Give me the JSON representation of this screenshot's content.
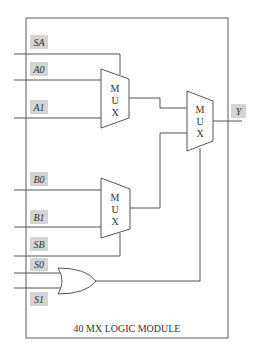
{
  "diagram": {
    "caption": "40 MX LOGIC MODULE",
    "inputs": [
      {
        "id": "SA",
        "label": "SA"
      },
      {
        "id": "A0",
        "label": "A0"
      },
      {
        "id": "A1",
        "label": "A1"
      },
      {
        "id": "B0",
        "label": "B0"
      },
      {
        "id": "B1",
        "label": "B1"
      },
      {
        "id": "SB",
        "label": "SB"
      },
      {
        "id": "S0",
        "label": "S0"
      },
      {
        "id": "S1",
        "label": "S1"
      }
    ],
    "output": {
      "id": "Y",
      "label": "Y"
    },
    "muxes": [
      {
        "id": "mux-a",
        "letters": [
          "M",
          "U",
          "X"
        ],
        "inputs": [
          "A0",
          "A1"
        ],
        "select": "SA"
      },
      {
        "id": "mux-b",
        "letters": [
          "M",
          "U",
          "X"
        ],
        "inputs": [
          "B0",
          "B1"
        ],
        "select": "SB"
      },
      {
        "id": "mux-out",
        "letters": [
          "M",
          "U",
          "X"
        ],
        "inputs": [
          "mux-a",
          "mux-b"
        ],
        "select": "or-gate"
      }
    ],
    "gates": [
      {
        "id": "or-gate",
        "type": "OR",
        "inputs": [
          "S0",
          "S1"
        ]
      }
    ]
  }
}
